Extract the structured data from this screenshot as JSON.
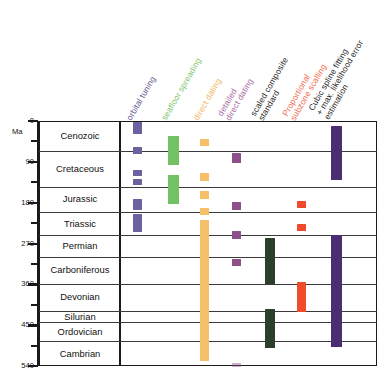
{
  "chart_data": {
    "type": "table",
    "title": "",
    "ylabel": "Ma",
    "ylim": [
      0,
      540
    ],
    "yticks_major": [
      0,
      90,
      180,
      270,
      360,
      450,
      540
    ],
    "yticks_minor": [
      45,
      135,
      225,
      315,
      405,
      495
    ],
    "grid": true,
    "legend_position": "top-rotated-headers",
    "y_axis_direction": "inverted",
    "row_label_header": "",
    "categories": [
      {
        "name": "Cenozoic",
        "start": 0,
        "end": 66
      },
      {
        "name": "Cretaceous",
        "start": 66,
        "end": 145
      },
      {
        "name": "Jurassic",
        "start": 145,
        "end": 201
      },
      {
        "name": "Triassic",
        "start": 201,
        "end": 252
      },
      {
        "name": "Permian",
        "start": 252,
        "end": 299
      },
      {
        "name": "Carboniferous",
        "start": 299,
        "end": 359
      },
      {
        "name": "Devonian",
        "start": 359,
        "end": 419
      },
      {
        "name": "Silurian",
        "start": 419,
        "end": 444
      },
      {
        "name": "Ordovician",
        "start": 444,
        "end": 485
      },
      {
        "name": "Cambrian",
        "start": 485,
        "end": 540
      }
    ],
    "series": [
      {
        "name": "orbital tuning",
        "label_lines": [
          "orbital tuning"
        ],
        "color": "#5b5490",
        "bar_color": "#6a63a0",
        "intervals": [
          {
            "start": 2,
            "end": 28
          },
          {
            "start": 58,
            "end": 72
          },
          {
            "start": 108,
            "end": 122
          },
          {
            "start": 128,
            "end": 142
          },
          {
            "start": 171,
            "end": 197
          },
          {
            "start": 205,
            "end": 245
          }
        ]
      },
      {
        "name": "seafloor spreading",
        "label_lines": [
          "seafloor spreading"
        ],
        "color": "#7cc46b",
        "bar_color": "#72c263",
        "intervals": [
          {
            "start": 34,
            "end": 98
          },
          {
            "start": 120,
            "end": 182
          }
        ]
      },
      {
        "name": "direct dating",
        "label_lines": [
          "direct dating"
        ],
        "color": "#f2b35a",
        "bar_color": "#f6bf69",
        "intervals": [
          {
            "start": 40,
            "end": 56
          },
          {
            "start": 115,
            "end": 132
          },
          {
            "start": 155,
            "end": 172
          },
          {
            "start": 192,
            "end": 208
          },
          {
            "start": 218,
            "end": 528
          }
        ]
      },
      {
        "name": "detailed direct dating",
        "label_lines": [
          "detailed",
          "direct dating"
        ],
        "color": "#a868a0",
        "bar_color": "#8e5088",
        "intervals": [
          {
            "start": 70,
            "end": 92
          },
          {
            "start": 178,
            "end": 196
          },
          {
            "start": 243,
            "end": 261
          },
          {
            "start": 305,
            "end": 320
          },
          {
            "start": 534,
            "end": 542
          }
        ]
      },
      {
        "name": "scaled composite standard",
        "label_lines": [
          "scaled composite",
          "standard"
        ],
        "color": "#1d1d1d",
        "bar_color": "#2b402b",
        "intervals": [
          {
            "start": 258,
            "end": 360
          },
          {
            "start": 415,
            "end": 500
          }
        ]
      },
      {
        "name": "Proportional subzone scalling",
        "label_lines": [
          "Proportional",
          "subzone scalling"
        ],
        "color": "#f0674a",
        "bar_color": "#f04b2a",
        "intervals": [
          {
            "start": 176,
            "end": 192
          },
          {
            "start": 226,
            "end": 242
          },
          {
            "start": 355,
            "end": 420
          }
        ]
      },
      {
        "name": "Cubic spline fitting + max. likelihood error estimation",
        "label_lines": [
          "Cubic spline fitting",
          "+ max. likelihood error",
          "estimation"
        ],
        "color": "#1d1d1d",
        "bar_color": "#4b2d74",
        "intervals": [
          {
            "start": 10,
            "end": 130
          },
          {
            "start": 252,
            "end": 498
          }
        ]
      }
    ]
  },
  "axis": {
    "unit": "Ma",
    "tick_labels": [
      "0",
      "90",
      "180",
      "270",
      "360",
      "450",
      "540"
    ]
  }
}
